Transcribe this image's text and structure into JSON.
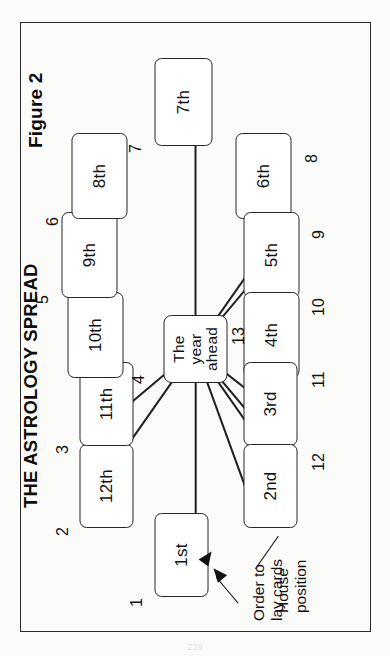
{
  "figure": {
    "label": "Figure 2",
    "title": "THE ASTROLOGY SPREAD"
  },
  "center_card": {
    "line1": "The",
    "line2": "year",
    "line3": "ahead",
    "order_number": "13"
  },
  "annotations": {
    "order_to_lay_cards": "Order to\nlay cards",
    "order_to_lay_cards_line1": "Order to",
    "order_to_lay_cards_line2": "lay cards",
    "house_position_line1": "House",
    "house_position_line2": "position"
  },
  "cards": [
    {
      "house": "1st",
      "order": "1",
      "x": 34,
      "y": 133,
      "w": 84,
      "h": 54,
      "num_x": 24,
      "num_y": 106
    },
    {
      "house": "12th",
      "order": "2",
      "x": 103,
      "y": 58,
      "w": 84,
      "h": 54,
      "num_x": 95,
      "num_y": 32
    },
    {
      "house": "11th",
      "order": "3",
      "x": 185,
      "y": 58,
      "w": 84,
      "h": 54,
      "num_x": 177,
      "num_y": 32
    },
    {
      "house": "10th",
      "order": "4",
      "x": 253,
      "y": 46,
      "w": 86,
      "h": 56,
      "num_x": 247,
      "num_y": 108
    },
    {
      "house": "9th",
      "order": "5",
      "x": 333,
      "y": 40,
      "w": 86,
      "h": 56,
      "num_x": 327,
      "num_y": 12
    },
    {
      "house": "8th",
      "order": "6",
      "x": 412,
      "y": 50,
      "w": 86,
      "h": 56,
      "num_x": 405,
      "num_y": 22
    },
    {
      "house": "7th",
      "order": "7",
      "x": 485,
      "y": 133,
      "w": 88,
      "h": 58,
      "num_x": 478,
      "num_y": 105
    },
    {
      "house": "6th",
      "order": "8",
      "x": 412,
      "y": 214,
      "w": 86,
      "h": 56,
      "num_x": 468,
      "num_y": 281
    },
    {
      "house": "5th",
      "order": "9",
      "x": 333,
      "y": 222,
      "w": 86,
      "h": 56,
      "num_x": 392,
      "num_y": 288
    },
    {
      "house": "4th",
      "order": "10",
      "x": 253,
      "y": 222,
      "w": 86,
      "h": 56,
      "num_x": 315,
      "num_y": 288
    },
    {
      "house": "3rd",
      "order": "11",
      "x": 185,
      "y": 222,
      "w": 84,
      "h": 54,
      "num_x": 243,
      "num_y": 288
    },
    {
      "house": "2nd",
      "order": "12",
      "x": 103,
      "y": 222,
      "w": 84,
      "h": 54,
      "num_x": 160,
      "num_y": 288
    }
  ],
  "colors": {
    "ink": "#1f1f1f",
    "card_fill": "#ffffff",
    "paper": "#fbfbf9"
  },
  "page_artifact": "239"
}
